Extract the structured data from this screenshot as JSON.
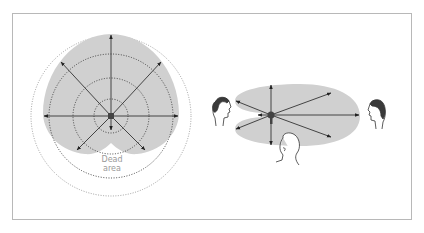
{
  "figure": {
    "left_diagram": {
      "title": "Cardioid microphone polar pickup pattern",
      "dead_area_label_line1": "Dead",
      "dead_area_label_line2": "area",
      "pickup_color": "#d0d0d0",
      "arrow_directions": [
        "up",
        "up-left",
        "up-right",
        "left",
        "right",
        "down-left",
        "down-right",
        "down"
      ]
    },
    "right_diagram": {
      "title": "Microphone pickup among three speakers",
      "pickup_color": "#d0d0d0",
      "speakers": [
        "left-speaker",
        "right-speaker",
        "front-speaker"
      ]
    },
    "colors": {
      "frame": "#b8b8b8",
      "shading": "#d0d0d0",
      "lines": "#333333",
      "label_text": "#9a9a9a"
    }
  }
}
